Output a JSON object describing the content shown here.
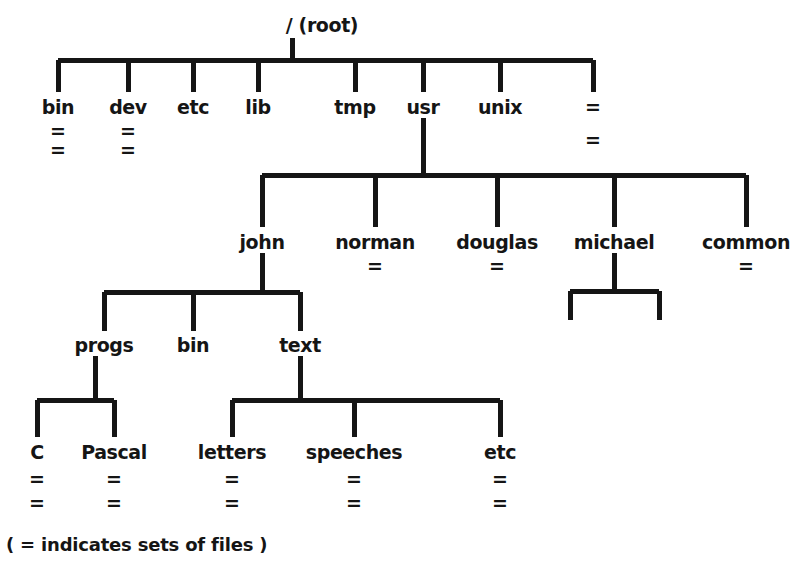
{
  "diagram": {
    "legend": "( = indicates sets of files )",
    "file_set_mark": "=",
    "line_color": "#151515",
    "text_color": "#151515",
    "background_color": "#ffffff",
    "root": {
      "label": "/ (root)",
      "x": 322,
      "y": 28
    },
    "level1": [
      {
        "label": "bin",
        "x": 58,
        "y": 110,
        "eq_count": 2
      },
      {
        "label": "dev",
        "x": 128,
        "y": 110,
        "eq_count": 2
      },
      {
        "label": "etc",
        "x": 193,
        "y": 110,
        "eq_count": 0
      },
      {
        "label": "lib",
        "x": 258,
        "y": 110,
        "eq_count": 0
      },
      {
        "label": "tmp",
        "x": 355,
        "y": 110,
        "eq_count": 0
      },
      {
        "label": "usr",
        "x": 423,
        "y": 110,
        "eq_count": 0
      },
      {
        "label": "unix",
        "x": 500,
        "y": 110,
        "eq_count": 0
      },
      {
        "label": "",
        "x": 593,
        "y": 110,
        "eq_count": 2
      }
    ],
    "level2_usr": [
      {
        "label": "john",
        "x": 262,
        "y": 245,
        "eq_count": 0
      },
      {
        "label": "norman",
        "x": 375,
        "y": 245,
        "eq_count": 1
      },
      {
        "label": "douglas",
        "x": 497,
        "y": 245,
        "eq_count": 1
      },
      {
        "label": "michael",
        "x": 614,
        "y": 245,
        "eq_count": 0
      },
      {
        "label": "common",
        "x": 746,
        "y": 245,
        "eq_count": 1
      }
    ],
    "level3_john": [
      {
        "label": "progs",
        "x": 104,
        "y": 348,
        "eq_count": 0
      },
      {
        "label": "bin",
        "x": 193,
        "y": 348,
        "eq_count": 0
      },
      {
        "label": "text",
        "x": 300,
        "y": 348,
        "eq_count": 0
      }
    ],
    "level4_progs": [
      {
        "label": "C",
        "x": 37,
        "y": 455,
        "eq_count": 2
      },
      {
        "label": "Pascal",
        "x": 114,
        "y": 455,
        "eq_count": 2
      }
    ],
    "level4_text": [
      {
        "label": "letters",
        "x": 232,
        "y": 455,
        "eq_count": 2
      },
      {
        "label": "speeches",
        "x": 354,
        "y": 455,
        "eq_count": 2
      },
      {
        "label": "etc",
        "x": 500,
        "y": 455,
        "eq_count": 2
      }
    ],
    "michael_stubs": [
      {
        "label": "",
        "x": 570,
        "y": 318
      },
      {
        "label": "",
        "x": 659,
        "y": 318
      }
    ]
  }
}
